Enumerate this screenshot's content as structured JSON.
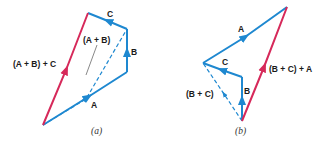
{
  "colors": {
    "vector": "#1e88d0",
    "resultant": "#d6295a",
    "leader": "#555555",
    "text": "#1a1a1a"
  },
  "diagrams": [
    {
      "caption": "(a)",
      "labels": {
        "A": "A",
        "B": "B",
        "C": "C",
        "sum_AB": "(A + B)",
        "result": "(A + B) + C"
      },
      "points": {
        "origin": [
          43,
          125
        ],
        "after_A": [
          127,
          72
        ],
        "after_B": [
          127,
          29
        ],
        "after_C": [
          88,
          13
        ]
      }
    },
    {
      "caption": "(b)",
      "labels": {
        "A": "A",
        "B": "B",
        "C": "C",
        "sum_BC": "(B + C)",
        "result": "(B + C) + A"
      },
      "points": {
        "origin": [
          242,
          121
        ],
        "after_B": [
          242,
          77
        ],
        "after_C": [
          203,
          63
        ],
        "after_A": [
          287,
          7
        ]
      }
    }
  ]
}
